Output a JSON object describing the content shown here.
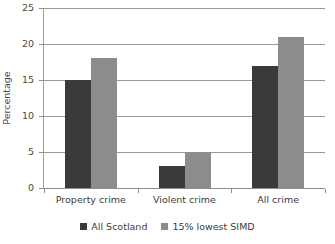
{
  "chart_data": {
    "type": "bar",
    "title": "",
    "subtitle": "",
    "xlabel": "",
    "ylabel": "Percentage",
    "categories": [
      "Property crime",
      "Violent crime",
      "All crime"
    ],
    "series": [
      {
        "name": "All Scotland",
        "color": "#3a3a3a",
        "values": [
          15,
          3,
          17
        ]
      },
      {
        "name": "15% lowest SIMD",
        "color": "#8c8c8c",
        "values": [
          18,
          5,
          21
        ]
      }
    ],
    "ylim": [
      0,
      25
    ],
    "yticks": [
      0,
      5,
      10,
      15,
      20,
      25
    ],
    "ytick_labels": [
      "0",
      "5",
      "10",
      "15",
      "20",
      "25"
    ],
    "grid": "horizontal",
    "legend_position": "bottom-center",
    "annotations": []
  },
  "axis": {
    "gridline_color": "#9a9a9a",
    "tick_color": "#8d8d8d",
    "text_color": "#3b3b3b"
  }
}
